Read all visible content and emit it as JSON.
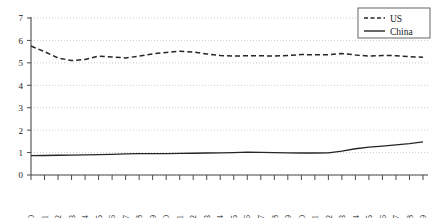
{
  "chart_data": {
    "type": "line",
    "title": "",
    "xlabel": "",
    "ylabel": "",
    "ylim": [
      0,
      7
    ],
    "yticks": [
      0,
      1,
      2,
      3,
      4,
      5,
      6,
      7
    ],
    "grid": true,
    "legend_position": "top-right",
    "categories": [
      "1980",
      "1981",
      "1982",
      "1983",
      "1984",
      "1985",
      "1986",
      "1987",
      "1988",
      "1989",
      "1990",
      "1991",
      "1992",
      "1993",
      "1994",
      "1995",
      "1996",
      "1997",
      "1998",
      "1999",
      "2000",
      "2001",
      "2002",
      "2003",
      "2004",
      "2005",
      "2006",
      "2007",
      "2008",
      "2009"
    ],
    "series": [
      {
        "name": "US",
        "style": "dashed",
        "color": "#262626",
        "values": [
          5.75,
          5.5,
          5.22,
          5.1,
          5.15,
          5.3,
          5.26,
          5.22,
          5.3,
          5.4,
          5.46,
          5.52,
          5.48,
          5.4,
          5.33,
          5.3,
          5.32,
          5.32,
          5.3,
          5.33,
          5.37,
          5.36,
          5.36,
          5.42,
          5.35,
          5.3,
          5.33,
          5.32,
          5.28,
          5.25
        ]
      },
      {
        "name": "China",
        "style": "solid",
        "color": "#262626",
        "values": [
          0.86,
          0.87,
          0.88,
          0.89,
          0.9,
          0.91,
          0.92,
          0.94,
          0.95,
          0.95,
          0.95,
          0.96,
          0.97,
          0.98,
          0.99,
          1.0,
          1.02,
          1.01,
          1.0,
          0.99,
          0.98,
          0.98,
          0.99,
          1.06,
          1.17,
          1.24,
          1.29,
          1.34,
          1.4,
          1.48
        ]
      }
    ]
  },
  "legend": {
    "entries": [
      {
        "label": "US"
      },
      {
        "label": "China"
      }
    ]
  }
}
